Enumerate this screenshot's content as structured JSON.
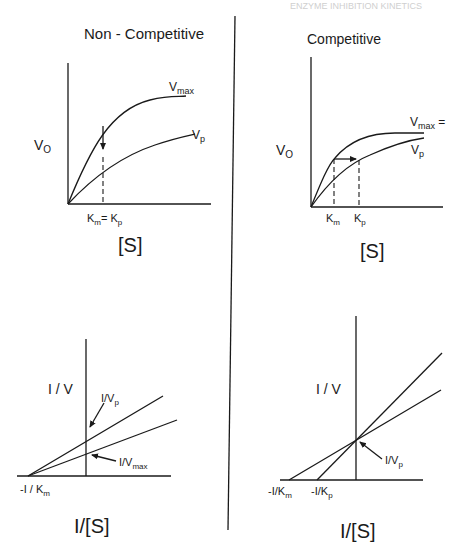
{
  "header": {
    "running_head": "ENZYME INHIBITION KINETICS"
  },
  "panels": {
    "noncompetitive": {
      "title": "Non - Competitive",
      "direct": {
        "ylabel": "V",
        "ylabel_sub": "O",
        "xlabel": "[S]",
        "curve1": "V",
        "curve1_sub": "max",
        "curve2": "V",
        "curve2_sub": "p",
        "tick": "K",
        "tick_sub1": "m",
        "tick_eq": "= K",
        "tick_sub2": "p"
      },
      "reciprocal": {
        "ylabel": "I / V",
        "xlabel": "I/[S]",
        "line1": "I/V",
        "line1_sub": "p",
        "line2": "I/V",
        "line2_sub": "max",
        "xint": "-I / K",
        "xint_sub": "m"
      }
    },
    "competitive": {
      "title": "Competitive",
      "direct": {
        "ylabel": "V",
        "ylabel_sub": "O",
        "xlabel": "[S]",
        "curve1": "V",
        "curve1_sub": "max",
        "curve1_suffix": " =",
        "curve2": "V",
        "curve2_sub": "p",
        "tick1": "K",
        "tick1_sub": "m",
        "tick2": "K",
        "tick2_sub": "p"
      },
      "reciprocal": {
        "ylabel": "I / V",
        "xlabel": "I/[S]",
        "line_label": "I/V",
        "line_label_sub": "p",
        "xint1": "-I/K",
        "xint1_sub": "m",
        "xint2": "-I/K",
        "xint2_sub": "p"
      }
    }
  },
  "colors": {
    "ink": "#1a1a1a",
    "background": "#ffffff"
  }
}
